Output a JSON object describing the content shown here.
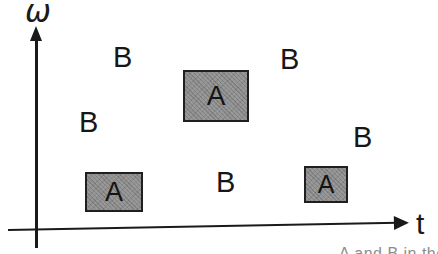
{
  "figure": {
    "axes": {
      "y_label": "ω",
      "x_label": "t"
    },
    "a_regions": [
      {
        "label": "A",
        "position": "top-center"
      },
      {
        "label": "A",
        "position": "bottom-left"
      },
      {
        "label": "A",
        "position": "bottom-right"
      }
    ],
    "b_marks": [
      {
        "label": "B",
        "position": "upper-left"
      },
      {
        "label": "B",
        "position": "upper-right"
      },
      {
        "label": "B",
        "position": "mid-left"
      },
      {
        "label": "B",
        "position": "mid-right"
      },
      {
        "label": "B",
        "position": "bottom-center"
      }
    ],
    "caption_fragment": "A and B in the",
    "colors": {
      "ink": "#1a1a1a",
      "region_fill": "#8e8e8e",
      "region_border": "#1f1f1f",
      "background": "#ffffff"
    }
  }
}
